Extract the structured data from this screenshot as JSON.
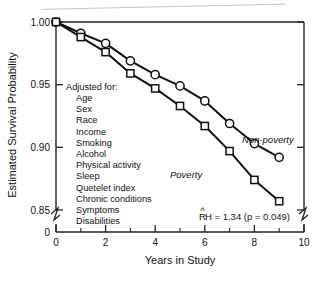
{
  "chart_data": {
    "type": "line",
    "title": "",
    "xlabel": "Years in Study",
    "ylabel": "Estimated Survival Probability",
    "xlim": [
      0,
      10
    ],
    "ylim": [
      0.85,
      1.0
    ],
    "y_axis_broken": true,
    "y_break_label": "0",
    "grid": false,
    "legend_position": "inline-at-curve-end",
    "x_ticks": [
      0,
      2,
      4,
      6,
      8,
      10
    ],
    "x_tick_labels": [
      "0",
      "2",
      "4",
      "6",
      "8",
      "10"
    ],
    "x_minor_ticks": [
      1,
      3,
      5,
      7,
      9
    ],
    "y_ticks": [
      0.85,
      0.9,
      0.95,
      1.0
    ],
    "y_tick_labels": [
      "0.85",
      "0.90",
      "0.95",
      "1.00"
    ],
    "x": [
      0,
      1,
      2,
      3,
      4,
      5,
      6,
      7,
      8,
      9
    ],
    "series": [
      {
        "name": "Non-poverty",
        "marker": "circle",
        "values": [
          1.0,
          0.991,
          0.983,
          0.969,
          0.958,
          0.949,
          0.937,
          0.919,
          0.903,
          0.892
        ]
      },
      {
        "name": "Poverty",
        "marker": "square",
        "values": [
          1.0,
          0.988,
          0.976,
          0.959,
          0.947,
          0.933,
          0.917,
          0.897,
          0.874,
          0.857
        ]
      }
    ],
    "annotations": [
      {
        "id": "hazard-ratio",
        "text": "RH = 1.34  (p = 0.049)",
        "text_prefix": "R",
        "text_hat": "^",
        "text_suffix": "H = 1.34  (p = 0.049)"
      }
    ]
  },
  "adjustment_note": {
    "heading": "Adjusted for:",
    "items": [
      "Age",
      "Sex",
      "Race",
      "Income",
      "Smoking",
      "Alcohol",
      "Physical activity",
      "Sleep",
      "Quetelet index",
      "Chronic conditions",
      "Symptoms",
      "Disabilities"
    ]
  },
  "colors": {
    "line": "#111111",
    "marker_fill": "#ffffff",
    "axis": "#222222",
    "text": "#111111",
    "background": "#ffffff"
  }
}
